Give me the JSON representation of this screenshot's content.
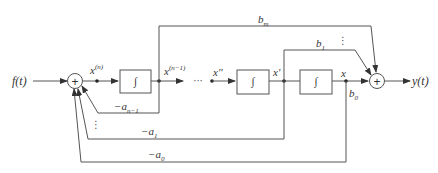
{
  "diagram": {
    "type": "state-variable block diagram (direct form, integrators)",
    "input_label": "f(t)",
    "output_label": "y(t)",
    "summer_symbol": "+",
    "integrator_symbol": "∫",
    "state_labels": {
      "xn": "x",
      "xn_sup": "(n)",
      "xn1": "x",
      "xn1_sup": "(n−1)",
      "x2": "x''",
      "x1": "x'",
      "x0": "x"
    },
    "ellipsis": "···",
    "vdots": "⋮",
    "feedback_gains": {
      "a_n_minus_1": "−a",
      "a_n_minus_1_sub": "n−1",
      "a1": "−a",
      "a1_sub": "1",
      "a0": "−a",
      "a0_sub": "0"
    },
    "feedforward_gains": {
      "bm": "b",
      "bm_sub": "m",
      "b1": "b",
      "b1_sub": "1",
      "b0": "b",
      "b0_sub": "0"
    },
    "colors": {
      "line": "#555555",
      "text": "#333333",
      "background": "#ffffff"
    }
  }
}
